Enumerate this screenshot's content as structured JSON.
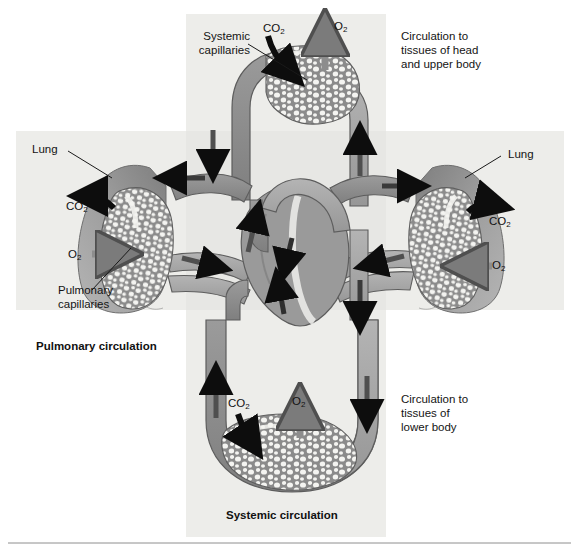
{
  "figure": {
    "title_alt": "Pulmonary and systemic circulation schematic",
    "bottom_rule": true
  },
  "palette": {
    "page_background": "#ffffff",
    "band_background": "#ededea",
    "vessel_deoxygenated": "#8d8d8d",
    "vessel_oxygenated": "#a8a8a8",
    "lung_tissue": "#9a9a9a",
    "capillary_mass": "#8f8f8f",
    "capillary_cell": "#f5f5f3",
    "arrow_dark": "#0d0d0d",
    "arrow_gray": "#6e6e6e",
    "outline": "#4a4a4a",
    "text": "#141414"
  },
  "bands": {
    "vertical": {
      "label": "systemic-vertical-band",
      "x": 186,
      "y": 14,
      "w": 200,
      "h": 523
    },
    "horizontal": {
      "label": "pulmonary-horizontal-band",
      "x": 16,
      "y": 131,
      "w": 548,
      "h": 179
    }
  },
  "labels": {
    "systemic_capillaries": "Systemic\ncapillaries",
    "lung_left": "Lung",
    "lung_right": "Lung",
    "pulmonary_capillaries": "Pulmonary\ncapillaries",
    "circulation_head": "Circulation to\ntissues of head\nand upper body",
    "circulation_lower": "Circulation to\ntissues of\nlower body"
  },
  "titles": {
    "pulmonary": "Pulmonary circulation",
    "systemic": "Systemic circulation"
  },
  "gas_markers": [
    {
      "name": "co2-top",
      "text": "CO",
      "sub": "2",
      "x": 263,
      "y": 22,
      "arrow": "dark-down-left"
    },
    {
      "name": "o2-top",
      "text": "O",
      "sub": "2",
      "x": 334,
      "y": 20,
      "arrow": "gray-up"
    },
    {
      "name": "co2-lung-left",
      "text": "CO",
      "sub": "2",
      "x": 66,
      "y": 200,
      "arrow": "dark-left"
    },
    {
      "name": "o2-lung-left",
      "text": "O",
      "sub": "2",
      "x": 68,
      "y": 248,
      "arrow": "gray-right"
    },
    {
      "name": "co2-lung-right",
      "text": "CO",
      "sub": "2",
      "x": 489,
      "y": 223,
      "arrow": "dark-right"
    },
    {
      "name": "o2-lung-right",
      "text": "O",
      "sub": "2",
      "x": 492,
      "y": 261,
      "arrow": "gray-left"
    },
    {
      "name": "co2-bottom",
      "text": "CO",
      "sub": "2",
      "x": 228,
      "y": 399,
      "arrow": "dark-down"
    },
    {
      "name": "o2-bottom",
      "text": "O",
      "sub": "2",
      "x": 292,
      "y": 397,
      "arrow": "gray-up"
    }
  ],
  "leader_lines": [
    {
      "name": "leader-systemic-capillaries",
      "x1": 248,
      "y1": 44,
      "x2": 307,
      "y2": 80
    },
    {
      "name": "leader-lung-left",
      "x1": 68,
      "y1": 151,
      "x2": 112,
      "y2": 178
    },
    {
      "name": "leader-lung-right",
      "x1": 501,
      "y1": 156,
      "x2": 465,
      "y2": 178
    },
    {
      "name": "leader-pulmonary-capillaries",
      "x1": 92,
      "y1": 290,
      "x2": 131,
      "y2": 248
    }
  ],
  "flow_arrows": [
    {
      "name": "arrow-descending-right-upper",
      "dir": "down",
      "x": 213,
      "y": 148
    },
    {
      "name": "arrow-ascending-right",
      "dir": "up",
      "x": 360,
      "y": 152
    },
    {
      "name": "arrow-to-left-lung",
      "dir": "left",
      "x": 182,
      "y": 176
    },
    {
      "name": "arrow-to-right-lung",
      "dir": "right",
      "x": 403,
      "y": 184
    },
    {
      "name": "arrow-left-lung-return",
      "dir": "right",
      "x": 198,
      "y": 252
    },
    {
      "name": "arrow-right-lung-return",
      "dir": "left",
      "x": 392,
      "y": 247
    },
    {
      "name": "arrow-heart-right-atrium",
      "dir": "down",
      "x": 289,
      "y": 253
    },
    {
      "name": "arrow-heart-left-ventricle",
      "dir": "up",
      "x": 281,
      "y": 300
    },
    {
      "name": "arrow-heart-outflow",
      "dir": "up",
      "x": 253,
      "y": 232
    },
    {
      "name": "arrow-aorta-descending",
      "dir": "down",
      "x": 366,
      "y": 300
    },
    {
      "name": "arrow-systemic-down-right",
      "dir": "down",
      "x": 365,
      "y": 398
    },
    {
      "name": "arrow-systemic-up-left",
      "dir": "up",
      "x": 216,
      "y": 398
    }
  ],
  "capillary_beds": [
    {
      "name": "systemic-capillary-bed-upper",
      "cx": 310,
      "cy": 82,
      "rx": 46,
      "ry": 36
    },
    {
      "name": "pulmonary-capillary-bed-left",
      "cx": 139,
      "cy": 238,
      "rx": 34,
      "ry": 52
    },
    {
      "name": "pulmonary-capillary-bed-right",
      "cx": 443,
      "cy": 238,
      "rx": 34,
      "ry": 52
    },
    {
      "name": "systemic-capillary-bed-lower",
      "cx": 292,
      "cy": 452,
      "rx": 66,
      "ry": 36
    }
  ]
}
